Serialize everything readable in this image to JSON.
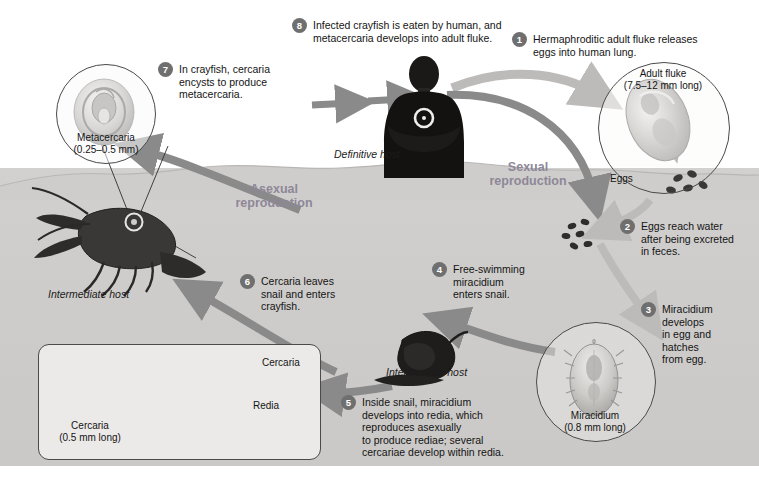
{
  "diagram": {
    "background_color": "#cfcdcb",
    "accent_color": "#8d8798",
    "bullet_color": "#6f6f6f"
  },
  "steps": [
    {
      "number": "1",
      "text": "Hermaphroditic adult fluke releases\neggs into human lung."
    },
    {
      "number": "2",
      "text": "Eggs reach water\nafter being excreted\nin feces."
    },
    {
      "number": "3",
      "text": "Miracidium\ndevelops\nin egg and\nhatches\nfrom egg."
    },
    {
      "number": "4",
      "text": "Free-swimming\nmiracidium\nenters snail."
    },
    {
      "number": "5",
      "text": "Inside snail, miracidium\ndevelops into redia, which\nreproduces asexually\nto produce rediae; several\ncercariae develop within redia."
    },
    {
      "number": "6",
      "text": "Cercaria leaves\nsnail and enters\ncrayfish."
    },
    {
      "number": "7",
      "text": "In crayfish, cercaria\nencysts to produce\nmetacercaria."
    },
    {
      "number": "8",
      "text": "Infected crayfish is eaten by human, and\nmetacercaria develops into adult fluke."
    }
  ],
  "reproduction_labels": [
    {
      "text": "Asexual\nreproduction"
    },
    {
      "text": "Sexual\nreproduction"
    }
  ],
  "host_labels": [
    {
      "text": "Definitive host"
    },
    {
      "text": "Intermediate host"
    },
    {
      "text": "Intermediate host"
    }
  ],
  "specimen_captions": {
    "metacercaria": "Metacercaria\n(0.25–0.5 mm)",
    "adult_fluke": "Adult fluke\n(7.5–12 mm long)",
    "miracidium": "Miracidium\n(0.8 mm long)",
    "cercaria": "Cercaria\n(0.5 mm long)"
  },
  "inline_labels": {
    "eggs": "Eggs",
    "cercaria": "Cercaria",
    "redia": "Redia"
  }
}
